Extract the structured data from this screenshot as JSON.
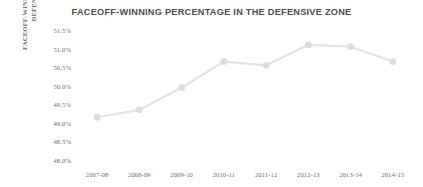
{
  "chart_data": {
    "type": "line",
    "title": "FACEOFF-WINNING PERCENTAGE IN THE DEFENSIVE ZONE",
    "xlabel": "",
    "ylabel_lines": [
      "FACEOFF-WINNING PERCENTAGE,",
      "DEFENSIVE ZONE"
    ],
    "categories": [
      "2007-08",
      "2008-09",
      "2009-10",
      "2010-11",
      "2011-12",
      "2012-13",
      "2013-14",
      "2014-15"
    ],
    "values": [
      49.15,
      49.35,
      49.95,
      50.65,
      50.55,
      51.1,
      51.05,
      50.65
    ],
    "value_labels": [
      "49.15%",
      "49.35%",
      "49.95%",
      "50.65%",
      "50.55%",
      "51.10%",
      "51.05%",
      "50.65%"
    ],
    "ylim": [
      48.0,
      51.5
    ],
    "ytick_values": [
      51.5,
      51.0,
      50.5,
      50.0,
      49.5,
      49.0,
      48.5,
      48.0
    ],
    "ytick_labels": [
      "51.5%",
      "51.0%",
      "50.5%",
      "50.0%",
      "49.5%",
      "49.0%",
      "48.5%",
      "48.0%"
    ],
    "grid": false,
    "legend": "none",
    "series_name": "Faceoff-winning percentage, defensive zone",
    "colors": {
      "background": "#ffffff",
      "line": "#e3e3e3",
      "marker": "#dcdcdc",
      "title_text": "#4d4d4d",
      "tick_text": "#6e6e6e",
      "axis_title_text": "#6b6b6b"
    }
  }
}
